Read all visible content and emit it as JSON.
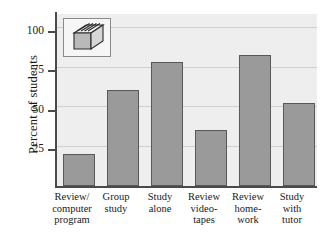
{
  "chart_data": {
    "type": "bar",
    "title": "",
    "subtitle": "",
    "xlabel": "",
    "ylabel": "Percent of students",
    "ylim": [
      0,
      108
    ],
    "yticks": [
      25,
      50,
      75,
      100
    ],
    "ytick_labels": [
      "25",
      "50",
      "75",
      "100"
    ],
    "grid": true,
    "legend": "none",
    "categories": [
      "Review/ computer program",
      "Group study",
      "Study alone",
      "Review video-tapes",
      "Review home-work",
      "Study with tutor"
    ],
    "category_lines": [
      [
        "Review/",
        "computer",
        "program"
      ],
      [
        "Group",
        "study"
      ],
      [
        "Study",
        "alone"
      ],
      [
        "Review",
        "video-",
        "tapes"
      ],
      [
        "Review",
        "home-",
        "work"
      ],
      [
        "Study",
        "with",
        "tutor"
      ]
    ],
    "values": [
      20,
      60,
      78,
      35,
      82,
      52
    ],
    "bar_color": "#9a9a9a",
    "bar_edge_color": "#585858",
    "panel_color": "#eeeeee",
    "grid_color": "#cfcfcf",
    "axis_color": "#4a4a4a"
  },
  "legend_icon": {
    "name": "book-stack-icon",
    "description": "3D stack of books"
  }
}
